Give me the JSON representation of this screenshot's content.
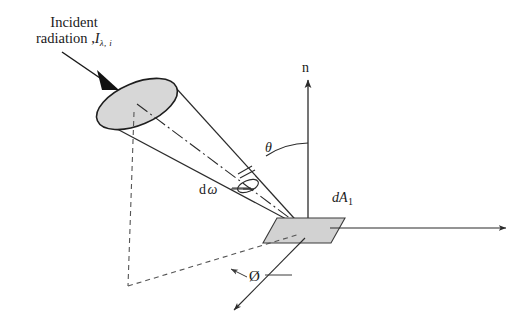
{
  "figure": {
    "width": 531,
    "height": 330,
    "background_color": "#ffffff",
    "line_color": "#2b2b2b",
    "shade_color": "#d7d7d7",
    "shade_color_surface": "#d2d2d2"
  },
  "labels": {
    "incident_line1": "Incident",
    "incident_line2": "radiation ,",
    "incident_symbol": "I",
    "incident_subscript": "λ, i",
    "normal_axis": "n",
    "polar_angle": "θ",
    "solid_angle_d": "d",
    "solid_angle_omega": "ω",
    "area_element": "dA",
    "area_element_subscript": "1",
    "azimuthal_angle": "Ø"
  },
  "geometry": {
    "cone_big_ellipse": {
      "cx": 137,
      "cy": 104,
      "rx": 43,
      "ry": 21,
      "rotation": -23
    },
    "cone_apex": {
      "x": 303,
      "y": 228
    },
    "cone_small_ellipse": {
      "cx": 248,
      "cy": 186,
      "rx": 11,
      "ry": 5.5,
      "rotation": -23
    },
    "surface_element_center": {
      "x": 305,
      "y": 229
    },
    "normal_axis_top": {
      "x": 308,
      "y": 72
    },
    "horizontal_axis_end": {
      "x": 508,
      "y": 228
    },
    "azimuth_axis_end": {
      "x": 232,
      "y": 312
    },
    "theta_arc_label_at": {
      "x": 272,
      "y": 147
    },
    "dashed_drop_bottom": {
      "x": 128,
      "y": 286
    }
  },
  "icons": {
    "incident_arrow": "arrow-down-right-filled",
    "normal_arrow": "arrow-up",
    "axis_arrow": "arrow-right",
    "azimuth_arrow": "arrow-down-left"
  }
}
